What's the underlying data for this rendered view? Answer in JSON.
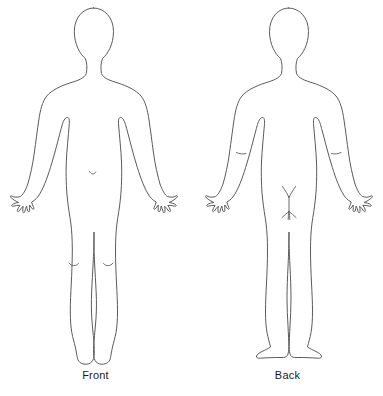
{
  "diagram": {
    "views": [
      {
        "id": "front",
        "label": "Front",
        "orientation": "anterior",
        "landmarks": [
          "head",
          "neck",
          "shoulders",
          "torso",
          "navel",
          "arms",
          "hands",
          "legs",
          "knees",
          "feet"
        ]
      },
      {
        "id": "back",
        "label": "Back",
        "orientation": "posterior",
        "landmarks": [
          "head",
          "neck",
          "shoulders",
          "torso",
          "arms",
          "elbow-creases",
          "hands",
          "gluteal-cleft",
          "legs",
          "feet"
        ]
      }
    ]
  },
  "colors": {
    "background": "#ffffff",
    "outline": "#5b5b5b",
    "detail": "#5b5b5b",
    "label_text": "#1a1a1a"
  }
}
